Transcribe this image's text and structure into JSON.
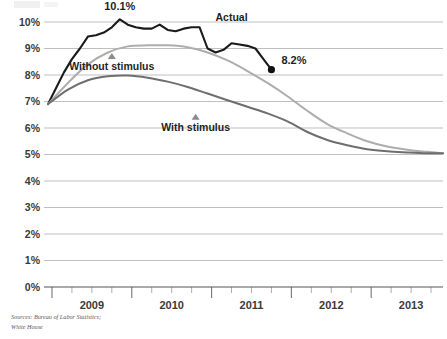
{
  "chart_data": {
    "type": "line",
    "title": "",
    "subtitle": "",
    "xlabel": "",
    "ylabel": "",
    "grid": true,
    "legend_position": "inline-annotations",
    "ylim": [
      0,
      10
    ],
    "xlim": [
      2008.9,
      2013.9
    ],
    "y_tick_labels": [
      "0%",
      "1%",
      "2%",
      "3%",
      "4%",
      "5%",
      "6%",
      "7%",
      "8%",
      "9%",
      "10%"
    ],
    "y_tick_values": [
      0,
      1,
      2,
      3,
      4,
      5,
      6,
      7,
      8,
      9,
      10
    ],
    "x_tick_labels": [
      "2009",
      "2010",
      "2011",
      "2012",
      "2013"
    ],
    "x_tick_values": [
      2009.5,
      2010.5,
      2011.5,
      2012.5,
      2013.5
    ],
    "x_minor_ticks_per_year": 4,
    "series": [
      {
        "name": "Actual",
        "color": "#1a1a1a",
        "x": [
          2008.95,
          2009.05,
          2009.15,
          2009.25,
          2009.35,
          2009.45,
          2009.55,
          2009.65,
          2009.75,
          2009.85,
          2009.95,
          2010.05,
          2010.15,
          2010.25,
          2010.35,
          2010.45,
          2010.55,
          2010.65,
          2010.75,
          2010.85,
          2010.95,
          2011.05,
          2011.15,
          2011.25,
          2011.35,
          2011.45,
          2011.55,
          2011.65,
          2011.75
        ],
        "values": [
          6.9,
          7.5,
          8.1,
          8.6,
          9.0,
          9.45,
          9.5,
          9.6,
          9.8,
          10.1,
          9.9,
          9.8,
          9.75,
          9.75,
          9.9,
          9.7,
          9.65,
          9.75,
          9.8,
          9.8,
          9.0,
          8.85,
          8.95,
          9.2,
          9.15,
          9.1,
          9.0,
          8.6,
          8.2
        ]
      },
      {
        "name": "Without stimulus",
        "color": "#adadad",
        "x": [
          2008.95,
          2009.2,
          2009.45,
          2009.7,
          2009.95,
          2010.2,
          2010.45,
          2010.7,
          2010.95,
          2011.2,
          2011.45,
          2011.7,
          2011.95,
          2012.2,
          2012.45,
          2012.7,
          2012.95,
          2013.2,
          2013.45,
          2013.7,
          2013.9
        ],
        "values": [
          6.9,
          7.7,
          8.4,
          8.85,
          9.08,
          9.12,
          9.12,
          9.05,
          8.85,
          8.55,
          8.15,
          7.7,
          7.2,
          6.65,
          6.15,
          5.8,
          5.5,
          5.3,
          5.18,
          5.1,
          5.05
        ]
      },
      {
        "name": "With stimulus",
        "color": "#6e6e6e",
        "x": [
          2008.95,
          2009.2,
          2009.45,
          2009.7,
          2009.95,
          2010.2,
          2010.45,
          2010.7,
          2010.95,
          2011.2,
          2011.45,
          2011.7,
          2011.95,
          2012.2,
          2012.45,
          2012.7,
          2012.95,
          2013.2,
          2013.45,
          2013.7,
          2013.9
        ],
        "values": [
          6.9,
          7.45,
          7.8,
          7.95,
          7.98,
          7.9,
          7.75,
          7.55,
          7.3,
          7.05,
          6.8,
          6.55,
          6.25,
          5.85,
          5.55,
          5.35,
          5.2,
          5.12,
          5.08,
          5.05,
          5.05
        ]
      }
    ],
    "annotations": [
      {
        "name": "peak-label",
        "text": "10.1%",
        "x": 2009.85,
        "y": 10.1
      },
      {
        "name": "endpoint-label",
        "text": "8.2%",
        "x": 2011.75,
        "y": 8.2
      },
      {
        "name": "actual-series-label",
        "text": "Actual",
        "x": 2011.25,
        "y": 9.75
      },
      {
        "name": "without-stimulus-label",
        "text": "Without stimulus",
        "x": 2009.75,
        "y": 8.35
      },
      {
        "name": "with-stimulus-label",
        "text": "With stimulus",
        "x": 2010.8,
        "y": 6.05
      }
    ],
    "markers": [
      {
        "name": "endpoint-dot",
        "shape": "circle",
        "x": 2011.75,
        "y": 8.2,
        "color": "#111111"
      },
      {
        "name": "without-stimulus-triangle",
        "shape": "triangle",
        "x": 2009.75,
        "y": 8.72,
        "color": "#8b8b8b"
      },
      {
        "name": "with-stimulus-triangle",
        "shape": "triangle",
        "x": 2010.8,
        "y": 6.42,
        "color": "#8b8b8b"
      }
    ]
  },
  "source": {
    "line1": "Sources: Bureau of Labor Statistics;",
    "line2": "White House"
  }
}
